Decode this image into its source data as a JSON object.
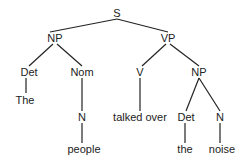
{
  "tree": {
    "nodes": [
      {
        "id": "S",
        "label": "S",
        "x": 117,
        "y": 13
      },
      {
        "id": "NP1",
        "label": "NP",
        "x": 55,
        "y": 38
      },
      {
        "id": "VP",
        "label": "VP",
        "x": 168,
        "y": 38
      },
      {
        "id": "Det1",
        "label": "Det",
        "x": 29,
        "y": 72
      },
      {
        "id": "Nom",
        "label": "Nom",
        "x": 82,
        "y": 72
      },
      {
        "id": "V",
        "label": "V",
        "x": 140,
        "y": 72
      },
      {
        "id": "NP2",
        "label": "NP",
        "x": 199,
        "y": 72
      },
      {
        "id": "The",
        "label": "The",
        "x": 25,
        "y": 100
      },
      {
        "id": "N1",
        "label": "N",
        "x": 82,
        "y": 117
      },
      {
        "id": "talked",
        "label": "talked over",
        "x": 140,
        "y": 117
      },
      {
        "id": "Det2",
        "label": "Det",
        "x": 186,
        "y": 117
      },
      {
        "id": "N2",
        "label": "N",
        "x": 220,
        "y": 117
      },
      {
        "id": "people",
        "label": "people",
        "x": 84,
        "y": 149
      },
      {
        "id": "the",
        "label": "the",
        "x": 185,
        "y": 149
      },
      {
        "id": "noise",
        "label": "noise",
        "x": 222,
        "y": 149
      }
    ],
    "edges": [
      [
        "S",
        "NP1"
      ],
      [
        "S",
        "VP"
      ],
      [
        "NP1",
        "Det1"
      ],
      [
        "NP1",
        "Nom"
      ],
      [
        "VP",
        "V"
      ],
      [
        "VP",
        "NP2"
      ],
      [
        "Det1",
        "The"
      ],
      [
        "Nom",
        "N1"
      ],
      [
        "V",
        "talked"
      ],
      [
        "NP2",
        "Det2"
      ],
      [
        "NP2",
        "N2"
      ],
      [
        "N1",
        "people"
      ],
      [
        "Det2",
        "the"
      ],
      [
        "N2",
        "noise"
      ]
    ]
  }
}
